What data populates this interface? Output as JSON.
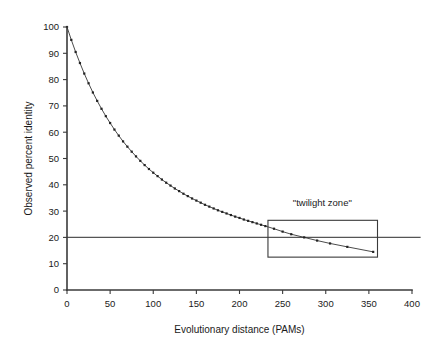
{
  "chart_data": {
    "type": "line",
    "title": "",
    "subtitle": "",
    "xlabel": "Evolutionary distance (PAMs)",
    "ylabel": "Observed percent identity",
    "xlim": [
      0,
      400
    ],
    "ylim": [
      0,
      100
    ],
    "xticks": [
      0,
      50,
      100,
      150,
      200,
      250,
      300,
      350,
      400
    ],
    "yticks": [
      0,
      10,
      20,
      30,
      40,
      50,
      60,
      70,
      80,
      90,
      100
    ],
    "xtick_labels": [
      "0",
      "50",
      "100",
      "150",
      "200",
      "250",
      "300",
      "350",
      "400"
    ],
    "ytick_labels": [
      "0",
      "10",
      "20",
      "30",
      "40",
      "50",
      "60",
      "70",
      "80",
      "90",
      "100"
    ],
    "grid": false,
    "legend": null,
    "legend_position": "none",
    "marker": "square",
    "series": [
      {
        "name": "observed percent identity",
        "x": [
          0,
          5,
          10,
          15,
          20,
          25,
          30,
          35,
          40,
          45,
          50,
          55,
          60,
          65,
          70,
          75,
          80,
          85,
          90,
          95,
          100,
          105,
          110,
          115,
          120,
          125,
          130,
          135,
          140,
          145,
          150,
          155,
          160,
          165,
          170,
          175,
          180,
          185,
          190,
          195,
          200,
          205,
          210,
          215,
          220,
          225,
          230,
          240,
          250,
          260,
          275,
          290,
          305,
          325,
          355
        ],
        "values": [
          100,
          95.1,
          90.5,
          86.3,
          82.3,
          78.6,
          75.1,
          71.9,
          68.9,
          66.1,
          63.5,
          61.0,
          58.7,
          56.5,
          54.5,
          52.6,
          50.8,
          49.1,
          47.5,
          46.0,
          44.6,
          43.3,
          42.0,
          40.8,
          39.7,
          38.6,
          37.6,
          36.6,
          35.7,
          34.8,
          34.0,
          33.2,
          32.4,
          31.7,
          31.0,
          30.3,
          29.7,
          29.1,
          28.5,
          27.9,
          27.4,
          26.8,
          26.3,
          25.8,
          25.3,
          24.8,
          24.3,
          23.3,
          22.2,
          21.2,
          20.0,
          18.8,
          17.7,
          16.4,
          14.5
        ]
      }
    ],
    "reference_lines": [
      {
        "name": "twenty-percent-identity-line",
        "orientation": "horizontal",
        "value": 20,
        "x_start": 0,
        "x_end": 410
      }
    ],
    "annotations": [
      {
        "name": "twilight-zone",
        "label": "\"twilight zone\"",
        "box": {
          "x0": 233,
          "x1": 360,
          "y0": 12.5,
          "y1": 26.5
        },
        "label_x": 296,
        "label_y": 32
      }
    ],
    "colors": {
      "axis": "#3a3a3a",
      "series": "#222222",
      "reference_line": "#555555",
      "annotation_box": "#3a3a3a",
      "background": "#ffffff",
      "text": "#1a1a1a"
    }
  }
}
